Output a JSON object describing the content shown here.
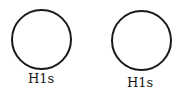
{
  "diagram": {
    "orbitals": [
      {
        "label": "H1s",
        "cx": 41,
        "cy": 39,
        "r": 30
      },
      {
        "label": "H1s",
        "cx": 141,
        "cy": 40,
        "r": 30
      }
    ],
    "stroke_color": "#1a1a1a",
    "background": "#ffffff"
  }
}
